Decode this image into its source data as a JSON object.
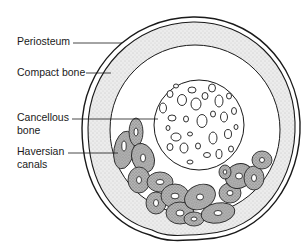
{
  "diagram": {
    "title": "",
    "type": "bone cross-section",
    "labels": [
      {
        "id": "periosteum",
        "lines": [
          "Periosteum"
        ]
      },
      {
        "id": "compact-bone",
        "lines": [
          "Compact bone"
        ]
      },
      {
        "id": "cancellous-bone",
        "lines": [
          "Cancellous",
          "bone"
        ]
      },
      {
        "id": "haversian-canals",
        "lines": [
          "Haversian",
          "canals"
        ]
      }
    ],
    "colors": {
      "line": "#1a1a1a",
      "compact_fill": "#e6e6e6",
      "haversian_fill": "#a8a8a8",
      "background": "#ffffff"
    }
  }
}
